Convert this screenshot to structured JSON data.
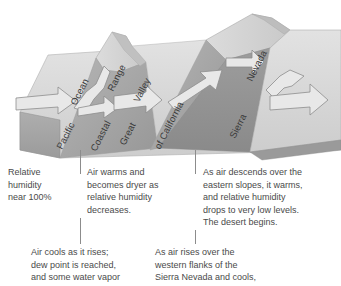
{
  "figure": {
    "title_alt": "Rain shadow effect across California",
    "terrain_labels": [
      {
        "id": "pacific",
        "text": "Pacific",
        "x": 54,
        "y": 146,
        "rot": -63
      },
      {
        "id": "ocean",
        "text": "Ocean",
        "x": 68,
        "y": 102,
        "rot": -63
      },
      {
        "id": "coastal",
        "text": "Coastal",
        "x": 88,
        "y": 148,
        "rot": -63
      },
      {
        "id": "range",
        "text": "Range",
        "x": 105,
        "y": 88,
        "rot": -63
      },
      {
        "id": "great",
        "text": "Great",
        "x": 117,
        "y": 142,
        "rot": -63
      },
      {
        "id": "valley",
        "text": "Valley",
        "x": 131,
        "y": 99,
        "rot": -63
      },
      {
        "id": "of-california",
        "text": "of California",
        "x": 152,
        "y": 146,
        "rot": -63
      },
      {
        "id": "sierra",
        "text": "Sierra",
        "x": 227,
        "y": 135,
        "rot": -63
      },
      {
        "id": "nevada",
        "text": "Nevada",
        "x": 244,
        "y": 78,
        "rot": -63
      }
    ],
    "arrows": [
      {
        "id": "arrow-onshore-flow",
        "label": ""
      },
      {
        "id": "arrow-over-coastal-range",
        "label": ""
      },
      {
        "id": "arrow-across-great-valley",
        "label": ""
      },
      {
        "id": "arrow-up-sierra-nevada",
        "label": ""
      },
      {
        "id": "arrow-descending-lee-side",
        "label": ""
      },
      {
        "id": "arrow-into-desert",
        "label": ""
      }
    ],
    "colors": {
      "top_surface": "#d0d0d0",
      "top_surface_light": "#dcdcdc",
      "side_face_dark": "#8e8e8e",
      "side_face_mid": "#a8a8a8",
      "slope_shadow": "#9a9a9a",
      "arrow_fill": "#e6e6e6",
      "arrow_stroke": "#8d8d8d",
      "label_text": "#3a3a3a",
      "body_text": "#4a4a4a",
      "rule": "#8c8c8c"
    }
  },
  "dividers": [
    {
      "id": "divider-upper-left",
      "x": 80,
      "y": 150,
      "height": 24
    },
    {
      "id": "divider-upper-right",
      "x": 195,
      "y": 150,
      "height": 24
    },
    {
      "id": "divider-lower-left",
      "x": 80,
      "y": 218,
      "height": 26
    },
    {
      "id": "divider-lower-right",
      "x": 195,
      "y": 230,
      "height": 14
    }
  ],
  "captions": {
    "relative_humidity": {
      "id": "caption-relative-humidity",
      "text": "Relative\nhumidity\nnear 100%",
      "x": 8,
      "y": 166,
      "width": 66
    },
    "air_warms": {
      "id": "caption-air-warms",
      "text": "Air warms and\nbecomes dryer as\nrelative humidity\ndecreases.",
      "x": 87,
      "y": 166,
      "width": 104
    },
    "descends_east": {
      "id": "caption-descends-east",
      "text": "As air descends over the\neastern slopes, it warms,\nand relative humidity\ndrops to very low levels.\nThe desert begins.",
      "x": 203,
      "y": 166,
      "width": 136
    },
    "air_cools": {
      "id": "caption-air-cools",
      "text": "Air cools as it rises;\ndew point is reached,\nand some water vapor",
      "x": 31,
      "y": 246,
      "width": 116
    },
    "rises_west": {
      "id": "caption-rises-west",
      "text": "As air rises over the\nwestern flanks of the\nSierra Nevada and cools,",
      "x": 155,
      "y": 246,
      "width": 130
    }
  }
}
